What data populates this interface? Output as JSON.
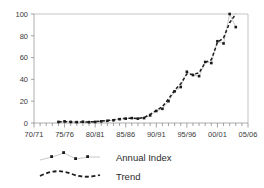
{
  "chart_data": {
    "type": "line",
    "title": "",
    "subtitle": "",
    "xlabel": "",
    "ylabel": "",
    "xlim": [
      "70/71",
      "05/06"
    ],
    "ylim": [
      0,
      100
    ],
    "grid": false,
    "legend_position": "bottom-left",
    "x_tick_labels": [
      "70/71",
      "75/76",
      "80/81",
      "85/86",
      "90/91",
      "95/96",
      "00/01",
      "05/06"
    ],
    "y_tick_labels": [
      "0",
      "20",
      "40",
      "60",
      "80",
      "100"
    ],
    "y_ticks": [
      0,
      20,
      40,
      60,
      80,
      100
    ],
    "x": [
      "74/75",
      "75/76",
      "76/77",
      "77/78",
      "78/79",
      "79/80",
      "80/81",
      "81/82",
      "82/83",
      "83/84",
      "84/85",
      "85/86",
      "86/87",
      "87/88",
      "88/89",
      "89/90",
      "90/91",
      "91/92",
      "92/93",
      "93/94",
      "94/95",
      "95/96",
      "96/97",
      "97/98",
      "98/99",
      "99/00",
      "00/01",
      "01/02",
      "02/03",
      "03/04"
    ],
    "series": [
      {
        "name": "Annual Index",
        "style": "line-with-markers",
        "color": "#1a1a1a",
        "line_color": "#b9b9b9",
        "values": [
          1,
          1.5,
          1,
          0.8,
          1.2,
          0.8,
          1,
          1.5,
          2,
          2.5,
          3.5,
          4,
          4.5,
          4,
          4.5,
          7,
          11,
          13,
          20,
          29,
          33,
          47,
          44,
          43,
          56,
          55,
          75,
          73,
          100,
          88
        ]
      },
      {
        "name": "Trend",
        "style": "dashed-line",
        "color": "#1d1d1d",
        "values": [
          1.2,
          1.2,
          1.0,
          1.0,
          1.0,
          1.0,
          1.2,
          1.7,
          2.2,
          3.0,
          3.8,
          4.2,
          4.3,
          4.2,
          5.0,
          8.0,
          11.5,
          15.0,
          22.0,
          30.0,
          36.0,
          45.0,
          44.5,
          46.0,
          55.5,
          58.0,
          74.0,
          78.0,
          92.0,
          100.0
        ]
      }
    ]
  },
  "legend": {
    "items": [
      {
        "label": "Annual Index",
        "marker": "square",
        "line": "solid-thin"
      },
      {
        "label": "Trend",
        "marker": "none",
        "line": "dashed-thick"
      }
    ]
  },
  "colors": {
    "background": "#ffffff",
    "axis": "#9a9a9a",
    "frame": "#b5b5b5",
    "marker": "#1a1a1a",
    "annual_line": "#b9b9b9",
    "trend_line": "#1d1d1d",
    "text": "#3a3a3a"
  }
}
